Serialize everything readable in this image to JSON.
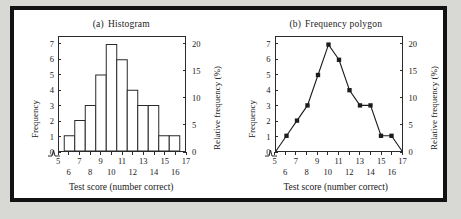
{
  "figure": {
    "background": "#ffffff",
    "border_color": "#121212",
    "page_background": "#d8d8d4"
  },
  "panels": [
    {
      "id": "histogram",
      "label": "(a)",
      "title": "Histogram"
    },
    {
      "id": "frequency-polygon",
      "label": "(b)",
      "title": "Frequency polygon"
    }
  ],
  "axes": {
    "x_title": "Test score (number correct)",
    "y_left_title": "Frequency",
    "y_right_title": "Relative frequency (%)",
    "x_ticks": [
      5,
      6,
      7,
      8,
      9,
      10,
      11,
      12,
      13,
      14,
      15,
      16,
      17
    ],
    "x_ticks_top_row": [
      5,
      7,
      9,
      11,
      13,
      15,
      17
    ],
    "x_ticks_bottom_row": [
      6,
      8,
      10,
      12,
      14,
      16
    ],
    "y_left_ticks": [
      0,
      1,
      2,
      3,
      4,
      5,
      6,
      7
    ],
    "y_right_ticks": [
      0,
      5,
      10,
      15,
      20
    ],
    "axis_break": true
  },
  "chart_data": [
    {
      "type": "bar",
      "title": "(a)  Histogram",
      "xlabel": "Test score (number correct)",
      "ylabel": "Frequency",
      "y2label": "Relative frequency (%)",
      "categories": [
        6,
        7,
        8,
        9,
        10,
        11,
        12,
        13,
        14,
        15,
        16
      ],
      "values": [
        1,
        2,
        3,
        5,
        7,
        6,
        4,
        3,
        3,
        1,
        1
      ],
      "relative_values": [
        2.9,
        5.7,
        8.6,
        14.3,
        20.0,
        17.1,
        11.4,
        8.6,
        8.6,
        2.9,
        2.9
      ],
      "xlim": [
        5,
        17
      ],
      "ylim": [
        0,
        7.5
      ],
      "y2lim": [
        0,
        21.4
      ],
      "grid": false,
      "legend": "none",
      "bar_fill": "#ffffff",
      "bar_stroke": "#2a2a2a"
    },
    {
      "type": "line",
      "title": "(b)  Frequency polygon",
      "xlabel": "Test score (number correct)",
      "ylabel": "Frequency",
      "y2label": "Relative frequency (%)",
      "x": [
        5,
        6,
        7,
        8,
        9,
        10,
        11,
        12,
        13,
        14,
        15,
        16,
        17
      ],
      "values": [
        0,
        1,
        2,
        3,
        5,
        7,
        6,
        4,
        3,
        3,
        1,
        1,
        0
      ],
      "relative_values": [
        0,
        2.9,
        5.7,
        8.6,
        14.3,
        20.0,
        17.1,
        11.4,
        8.6,
        8.6,
        2.9,
        2.9,
        0
      ],
      "xlim": [
        5,
        17
      ],
      "ylim": [
        0,
        7.5
      ],
      "y2lim": [
        0,
        21.4
      ],
      "grid": false,
      "legend": "none",
      "marker": "filled-square",
      "line_color": "#1b1b1b"
    }
  ]
}
